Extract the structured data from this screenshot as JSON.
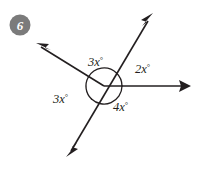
{
  "problem": {
    "number": "6",
    "badge_color": "#7b7b7b",
    "badge_text_color": "#ffffff"
  },
  "diagram": {
    "type": "intersecting-lines-angles",
    "stroke_color": "#231f20",
    "background_color": "#ffffff",
    "center": {
      "x": 104,
      "y": 86
    },
    "arc_radius": 18,
    "rays": [
      {
        "name": "ray-upper-right",
        "angle_deg": 46,
        "tip": {
          "x": 152,
          "y": 15
        },
        "arrow": true
      },
      {
        "name": "ray-right",
        "angle_deg": 0,
        "tip": {
          "x": 190,
          "y": 86
        },
        "arrow": true
      },
      {
        "name": "ray-lower-left",
        "angle_deg": 226,
        "tip": {
          "x": 67,
          "y": 155
        },
        "arrow": true
      },
      {
        "name": "ray-upper-left",
        "angle_deg": 150,
        "tip": {
          "x": 37,
          "y": 44
        },
        "arrow": true
      }
    ],
    "angles": [
      {
        "name": "angle-top",
        "label": "3x",
        "unit": "°",
        "label_x": 88,
        "label_y": 66,
        "arc_from_deg": 46,
        "arc_to_deg": 150
      },
      {
        "name": "angle-right",
        "label": "2x",
        "unit": "°",
        "label_x": 135,
        "label_y": 73,
        "arc_from_deg": 0,
        "arc_to_deg": 46
      },
      {
        "name": "angle-bottom",
        "label": "4x",
        "unit": "°",
        "label_x": 113,
        "label_y": 111,
        "arc_from_deg": 226,
        "arc_to_deg": 360
      },
      {
        "name": "angle-left",
        "label": "3x",
        "unit": "°",
        "label_x": 55,
        "label_y": 103,
        "arc_from_deg": 150,
        "arc_to_deg": 226
      }
    ]
  }
}
